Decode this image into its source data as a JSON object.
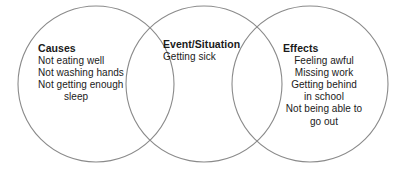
{
  "diagram": {
    "type": "venn-diagram",
    "stroke_color": "#8a8a8a",
    "background_color": "#ffffff",
    "text_color": "#1a1a1a",
    "circles": [
      {
        "id": "causes",
        "cx": 96,
        "cy": 84,
        "r": 78
      },
      {
        "id": "event",
        "cx": 204,
        "cy": 84,
        "r": 78
      },
      {
        "id": "effects",
        "cx": 310,
        "cy": 84,
        "r": 78
      }
    ],
    "sections": {
      "causes": {
        "heading": "Causes",
        "lines": [
          "Not eating well",
          "Not washing hands",
          "Not getting enough",
          "sleep"
        ]
      },
      "event": {
        "heading": "Event/Situation",
        "lines": [
          "Getting sick"
        ]
      },
      "effects": {
        "heading": "Effects",
        "lines": [
          "Feeling awful",
          "Missing work",
          "Getting behind",
          "in school",
          "Not being able to",
          "go out"
        ]
      }
    }
  }
}
